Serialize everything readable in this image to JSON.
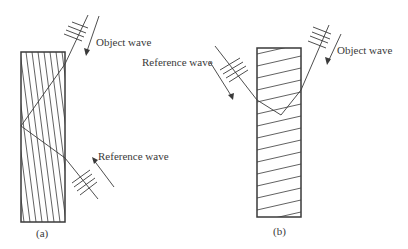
{
  "figure": {
    "panels": [
      {
        "id": "a",
        "caption": "(a)",
        "object_wave_label": "Object wave",
        "reference_wave_label": "Reference wave",
        "fringe_orientation": "near-vertical (slanted), transmission hologram"
      },
      {
        "id": "b",
        "caption": "(b)",
        "object_wave_label": "Object wave",
        "reference_wave_label": "Reference wave",
        "fringe_orientation": "near-horizontal (slanted), reflection hologram"
      }
    ],
    "colors": {
      "line": "#3a3a3a",
      "background": "#ffffff"
    }
  }
}
